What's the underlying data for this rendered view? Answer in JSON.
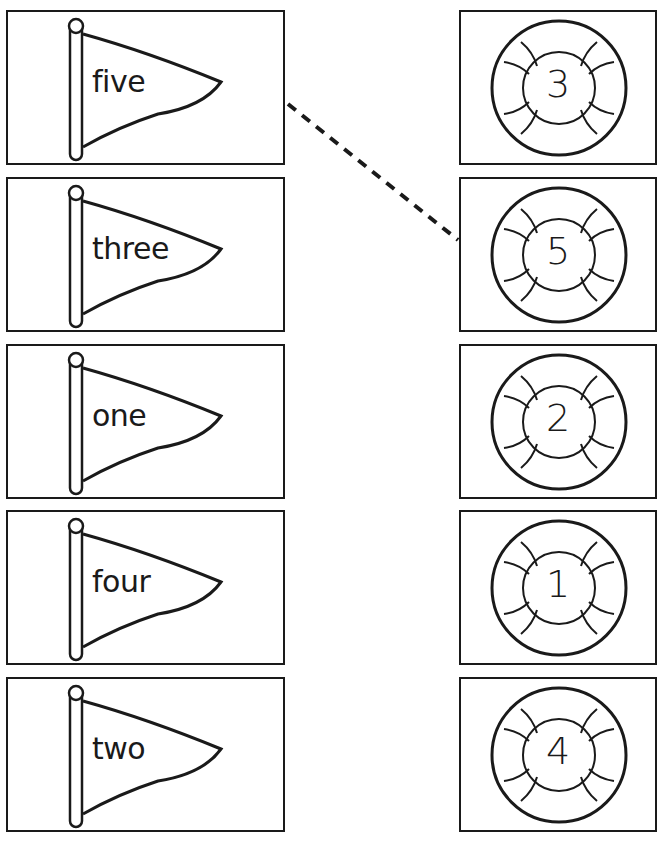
{
  "worksheet": {
    "flags": [
      {
        "word": "five"
      },
      {
        "word": "three"
      },
      {
        "word": "one"
      },
      {
        "word": "four"
      },
      {
        "word": "two"
      }
    ],
    "life_rings": [
      {
        "number": "3"
      },
      {
        "number": "5"
      },
      {
        "number": "2"
      },
      {
        "number": "1"
      },
      {
        "number": "4"
      }
    ],
    "example_match": {
      "from_flag": "five",
      "to_ring": "5",
      "style": "dashed"
    },
    "colors": {
      "ink": "#1a1a1a",
      "paper": "#ffffff"
    }
  }
}
